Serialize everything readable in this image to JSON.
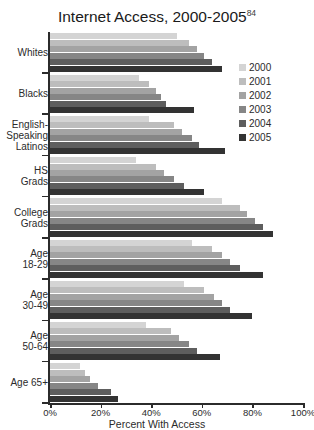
{
  "chart_data": {
    "type": "bar",
    "orientation": "horizontal",
    "title": "Internet Access, 2000-2005",
    "title_superscript": "84",
    "xlabel": "Percent With Access",
    "ylabel": "",
    "xlim": [
      0,
      100
    ],
    "xticks": [
      "0%",
      "20%",
      "40%",
      "60%",
      "80%",
      "100%"
    ],
    "xtick_values": [
      0,
      20,
      40,
      60,
      80,
      100
    ],
    "grid": false,
    "legend_position": "right",
    "categories": [
      "Whites",
      "Blacks",
      "English-\nSpeaking\nLatinos",
      "HS\nGrads",
      "College\nGrads",
      "Age\n18-29",
      "Age\n30-49",
      "Age\n50-64",
      "Age 65+"
    ],
    "series": [
      {
        "name": "2000",
        "color": "#d4d4d4",
        "values": [
          50,
          35,
          39,
          34,
          68,
          56,
          53,
          38,
          12
        ]
      },
      {
        "name": "2001",
        "color": "#bdbdbd",
        "values": [
          55,
          39,
          49,
          42,
          75,
          64,
          61,
          48,
          14
        ]
      },
      {
        "name": "2002",
        "color": "#a3a3a3",
        "values": [
          58,
          42,
          52,
          45,
          78,
          68,
          65,
          51,
          16
        ]
      },
      {
        "name": "2003",
        "color": "#868686",
        "values": [
          61,
          44,
          56,
          49,
          81,
          71,
          68,
          55,
          19
        ]
      },
      {
        "name": "2004",
        "color": "#5e5e5e",
        "values": [
          64,
          46,
          59,
          53,
          84,
          75,
          71,
          58,
          24
        ]
      },
      {
        "name": "2005",
        "color": "#333333",
        "values": [
          68,
          57,
          69,
          61,
          88,
          84,
          80,
          67,
          27
        ]
      }
    ]
  },
  "legend": {
    "items": [
      {
        "label": "2000",
        "color": "#d4d4d4"
      },
      {
        "label": "2001",
        "color": "#bdbdbd"
      },
      {
        "label": "2002",
        "color": "#a3a3a3"
      },
      {
        "label": "2003",
        "color": "#868686"
      },
      {
        "label": "2004",
        "color": "#5e5e5e"
      },
      {
        "label": "2005",
        "color": "#333333"
      }
    ]
  }
}
